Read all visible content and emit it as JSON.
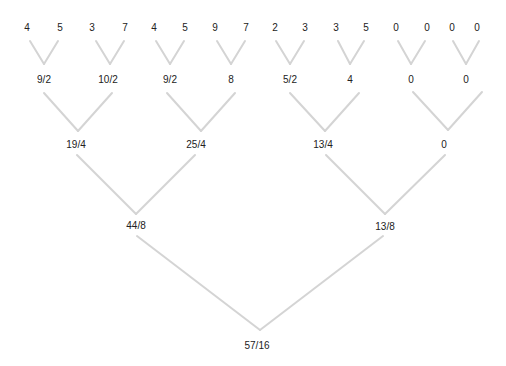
{
  "diagram": {
    "type": "binary-averaging-tree",
    "line_color": "#d4d4d4",
    "text_color": "#222222",
    "leaves": [
      "4",
      "5",
      "3",
      "7",
      "4",
      "5",
      "9",
      "7",
      "2",
      "3",
      "3",
      "5",
      "0",
      "0",
      "0",
      "0"
    ],
    "level1": [
      "9/2",
      "10/2",
      "9/2",
      "8",
      "5/2",
      "4",
      "0",
      "0"
    ],
    "level2": [
      "19/4",
      "25/4",
      "13/4",
      "0"
    ],
    "level3": [
      "44/8",
      "13/8"
    ],
    "root": "57/16"
  }
}
